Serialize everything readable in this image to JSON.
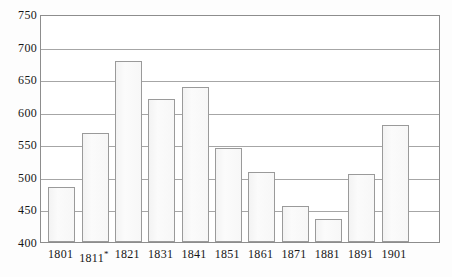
{
  "chart_data": {
    "type": "bar",
    "title": "",
    "subtitle": "",
    "xlabel": "",
    "ylabel": "",
    "categories": [
      "1801",
      "1811*",
      "1821",
      "1831",
      "1841",
      "1851",
      "1861",
      "1871",
      "1881",
      "1891",
      "1901"
    ],
    "values": [
      484,
      568,
      678,
      619,
      638,
      544,
      508,
      456,
      435,
      505,
      580
    ],
    "ylim": [
      400,
      750
    ],
    "yticks": [
      400,
      450,
      500,
      550,
      600,
      650,
      700,
      750
    ],
    "ytick_labels": [
      "400",
      "450",
      "500",
      "550",
      "600",
      "650",
      "700",
      "750"
    ],
    "xtick_labels": [
      "1801",
      "1811*",
      "1821",
      "1831",
      "1841",
      "1851",
      "1861",
      "1871",
      "1881",
      "1891",
      "1901"
    ],
    "grid": true,
    "legend": "none",
    "annotations": [
      "* asterisk on 1811 category label"
    ],
    "colors": {
      "bar_fill": "#f7f7f7",
      "bar_stroke": "#9a9a9a",
      "gridline": "#a6a6a6",
      "frame": "#8d8d8d",
      "text": "#161616",
      "background": "#ffffff"
    }
  }
}
